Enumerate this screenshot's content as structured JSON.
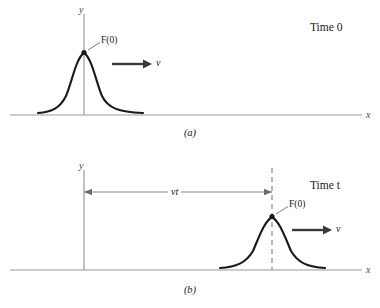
{
  "figure": {
    "axis": {
      "x_label": "x",
      "y_label": "y"
    },
    "panels": [
      {
        "id": "a",
        "caption": "(a)",
        "time_label": "Time 0",
        "peak_label": "F(0)",
        "velocity_label": "v",
        "pulse": {
          "peak_x": 84,
          "peak_y": 52,
          "baseline_y": 115,
          "left_x": 38,
          "right_x": 143
        },
        "axes": {
          "x_axis_y": 115,
          "x_axis_start": 10,
          "x_axis_end": 362,
          "y_axis_x": 84,
          "y_axis_top": 14,
          "y_axis_bottom": 115
        },
        "velocity_arrow": {
          "x1": 112,
          "x2": 146,
          "y": 64
        },
        "leader_line": {
          "x1": 88,
          "y1": 50,
          "x2": 100,
          "y2": 42
        }
      },
      {
        "id": "b",
        "caption": "(b)",
        "time_label": "Time t",
        "peak_label": "F(0)",
        "velocity_label": "v",
        "distance_label": "vt",
        "pulse": {
          "peak_x": 272,
          "peak_y": 62,
          "baseline_y": 116,
          "left_x": 220,
          "right_x": 325
        },
        "axes": {
          "x_axis_y": 116,
          "x_axis_start": 10,
          "x_axis_end": 362,
          "y_axis_x": 84,
          "y_axis_top": 16,
          "y_axis_bottom": 116
        },
        "dashed_line": {
          "x": 272,
          "y_top": 14,
          "y_bottom": 116
        },
        "distance_arrow": {
          "x1": 84,
          "x2": 272,
          "y": 38
        },
        "velocity_arrow": {
          "x1": 292,
          "x2": 328,
          "y": 76
        },
        "leader_line": {
          "x1": 276,
          "y1": 60,
          "x2": 288,
          "y2": 52
        }
      }
    ],
    "colors": {
      "curve": "#1a1a1a",
      "axis": "#9a9a9a",
      "dashed": "#9a9a9a",
      "arrow_thick": "#3a3a3a",
      "arrow_thin": "#8a8a8a",
      "text": "#1a1a1a"
    }
  }
}
